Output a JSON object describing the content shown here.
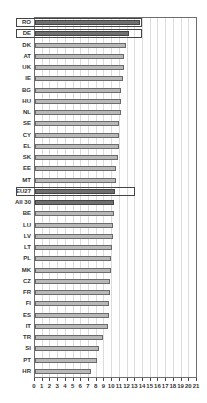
{
  "chart_data": {
    "type": "bar",
    "orientation": "horizontal",
    "title": "",
    "xlabel": "",
    "ylabel": "",
    "xlim": [
      0,
      21
    ],
    "x_ticks": [
      0,
      1,
      2,
      3,
      4,
      5,
      6,
      7,
      8,
      9,
      10,
      11,
      12,
      13,
      14,
      15,
      16,
      17,
      18,
      19,
      20,
      21
    ],
    "grid": "vertical",
    "legend": "none",
    "categories": [
      "RO",
      "DE",
      "DK",
      "AT",
      "UK",
      "IE",
      "BG",
      "HU",
      "NL",
      "SE",
      "CY",
      "EL",
      "SK",
      "EE",
      "MT",
      "EU27",
      "All 30",
      "BE",
      "LU",
      "LV",
      "LT",
      "PL",
      "MK",
      "CZ",
      "FR",
      "FI",
      "ES",
      "IT",
      "TR",
      "SI",
      "PT",
      "HR"
    ],
    "values": [
      13.6,
      12.2,
      11.8,
      11.6,
      11.6,
      11.4,
      11.2,
      11.1,
      11.1,
      10.9,
      10.9,
      10.9,
      10.7,
      10.5,
      10.5,
      10.4,
      10.3,
      10.3,
      10.1,
      10.1,
      10.0,
      9.9,
      9.9,
      9.7,
      9.7,
      9.6,
      9.6,
      9.4,
      8.8,
      8.3,
      8.1,
      7.3
    ],
    "highlight_boxes": [
      {
        "category": "RO",
        "end": 14.0
      },
      {
        "category": "DE",
        "end": 14.0
      },
      {
        "category": "EU27",
        "end": 13.1
      }
    ],
    "dark_bars": [
      "RO",
      "DE",
      "EU27",
      "All 30"
    ],
    "colors": {
      "bar_fill": "#b9b9b9",
      "bar_dark_fill": "#6f6f6f",
      "bar_border": "#6a6a6a",
      "grid": "#dcdcdc",
      "frame": "#6e6e6e"
    }
  }
}
